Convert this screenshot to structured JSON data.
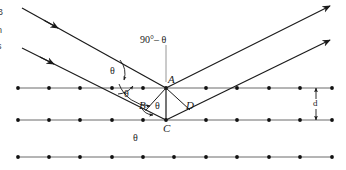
{
  "figure": {
    "kind": "bragg-diffraction-diagram",
    "background_color": "#ffffff",
    "ink_color": "#1a1a1a",
    "width": 346,
    "height": 170,
    "caption_fragments": [
      {
        "text": "B",
        "top": 8
      },
      {
        "text": "n",
        "top": 26
      },
      {
        "text": "s",
        "top": 42
      },
      {
        "text": ".",
        "top": 58
      }
    ],
    "labels": {
      "point_a": "A",
      "point_b": "B",
      "point_c": "C",
      "point_d": "D",
      "theta_upper": "θ",
      "theta_lower": "θ",
      "theta_inner": "θ",
      "theta_bottom": "θ",
      "complement_angle": "90°– θ",
      "spacing": "d"
    },
    "lattice": {
      "rows": [
        {
          "y": 88,
          "dot_count": 11
        },
        {
          "y": 120,
          "dot_count": 11
        },
        {
          "y": 157,
          "dot_count": 11
        }
      ],
      "x_start": 18,
      "x_end": 332,
      "dot_radius": 1.9,
      "line_color": "#6a6a6a",
      "dot_color": "#111111"
    },
    "rays": {
      "incoming": [
        {
          "x1": 22,
          "y1": 8,
          "x2": 166,
          "y2": 88,
          "arrow_at": 0.2
        },
        {
          "x1": 22,
          "y1": 48,
          "x2": 166,
          "y2": 120,
          "arrow_at": 0.2
        }
      ],
      "outgoing": [
        {
          "x1": 166,
          "y1": 88,
          "x2": 330,
          "y2": 6,
          "arrow_at": 1.0
        },
        {
          "x1": 166,
          "y1": 120,
          "x2": 330,
          "y2": 40,
          "arrow_at": 1.0
        }
      ]
    },
    "triangle": {
      "apex_a": {
        "x": 166,
        "y": 88
      },
      "apex_c": {
        "x": 166,
        "y": 120
      },
      "foot_b": {
        "x": 145,
        "y": 110
      },
      "foot_d": {
        "x": 190,
        "y": 110
      }
    },
    "spacing_marker": {
      "x": 316,
      "y_top": 88,
      "y_bottom": 120
    }
  }
}
